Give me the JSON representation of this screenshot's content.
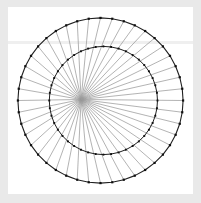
{
  "figure": {
    "title": "",
    "canvas": {
      "width": 201,
      "height": 203
    },
    "background_color": "#e9e9e9",
    "plot_area": {
      "x": 8,
      "y": 7,
      "width": 185,
      "height": 187,
      "fill_color": "#ffffff"
    },
    "faint_band": {
      "y": 41,
      "height": 3,
      "color": "#efefef"
    }
  },
  "chart_data": {
    "type": "scatter",
    "title": "",
    "subtitle": "",
    "xlabel": "",
    "ylabel": "",
    "grid": false,
    "legend": null,
    "xlim": [
      -1.12,
      1.12
    ],
    "ylim": [
      -1.12,
      1.12
    ],
    "series": [
      {
        "name": "outer-circle",
        "kind": "polygon-with-markers",
        "n_points": 44,
        "radius": 1.0,
        "center": [
          0.0,
          0.0
        ],
        "start_angle_deg": 90,
        "stroke_color": "#202020",
        "stroke_width": 1.1,
        "marker": "square",
        "marker_size": 2.2,
        "marker_color": "#101010"
      },
      {
        "name": "inner-circle",
        "kind": "polygon-with-markers",
        "n_points": 44,
        "radius": 0.655,
        "center": [
          0.035,
          0.0
        ],
        "start_angle_deg": 90,
        "stroke_color": "#202020",
        "stroke_width": 1.0,
        "marker": "square",
        "marker_size": 1.9,
        "marker_color": "#101010"
      },
      {
        "name": "radiating-chords",
        "kind": "line-fan",
        "n_lines": 44,
        "from": "outer-circle-vertices",
        "focus": [
          -0.235,
          0.012
        ],
        "stroke_color": "#9a9a9a",
        "stroke_width": 0.8,
        "opacity": 0.95
      }
    ],
    "colors": {
      "circle_stroke": "#202020",
      "chord_stroke": "#9a9a9a",
      "marker_fill": "#101010",
      "plot_background": "#ffffff",
      "figure_background": "#e9e9e9"
    }
  }
}
